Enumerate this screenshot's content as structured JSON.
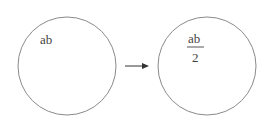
{
  "diagram": {
    "left_circle": {
      "label": "ab"
    },
    "right_circle": {
      "numerator": "ab",
      "denominator": "2"
    },
    "arrow": {
      "direction": "right"
    },
    "colors": {
      "stroke": "#8a8a8a",
      "text": "#444444",
      "arrow": "#333333"
    }
  }
}
